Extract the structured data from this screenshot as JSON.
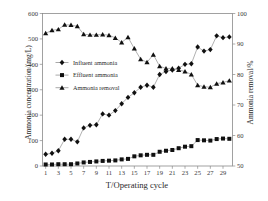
{
  "chart_data": {
    "type": "line",
    "title": "",
    "xlabel": "T/Operating cycle",
    "ylabel_left": "Ammonia concentration/(mg/L)",
    "ylabel_right": "Ammonia removal/%",
    "x": [
      1,
      2,
      3,
      4,
      5,
      6,
      7,
      8,
      9,
      10,
      11,
      12,
      13,
      14,
      15,
      16,
      17,
      18,
      19,
      20,
      21,
      22,
      23,
      24,
      25,
      26,
      27,
      28,
      29,
      30
    ],
    "xticks": [
      1,
      3,
      5,
      7,
      9,
      11,
      13,
      15,
      17,
      19,
      21,
      23,
      25,
      27,
      29
    ],
    "xlim": [
      0.5,
      30.5
    ],
    "yticks_left": [
      0,
      100,
      200,
      300,
      400,
      500,
      600
    ],
    "ylim_left": [
      0,
      600
    ],
    "yticks_right": [
      50,
      60,
      70,
      80,
      90,
      100
    ],
    "ylim_right": [
      50,
      100
    ],
    "grid": false,
    "legend_position": "upper-left-inside",
    "series": [
      {
        "name": "Influent ammonia",
        "marker": "diamond",
        "axis": "left",
        "values": [
          46,
          50,
          60,
          105,
          105,
          95,
          150,
          160,
          162,
          205,
          200,
          218,
          245,
          270,
          288,
          310,
          318,
          310,
          360,
          372,
          378,
          385,
          400,
          402,
          468,
          452,
          458,
          512,
          505,
          508
        ]
      },
      {
        "name": "Effluent ammonia",
        "marker": "square",
        "axis": "left",
        "values": [
          6,
          6,
          7,
          7,
          7,
          10,
          14,
          16,
          18,
          20,
          21,
          22,
          26,
          28,
          38,
          42,
          44,
          44,
          56,
          60,
          63,
          70,
          76,
          78,
          102,
          101,
          100,
          106,
          108,
          107
        ]
      },
      {
        "name": "Ammonia removal",
        "marker": "triangle",
        "axis": "right",
        "values": [
          93.5,
          94.5,
          94.8,
          96.3,
          96.2,
          95.8,
          93.2,
          93.0,
          93.0,
          93.1,
          92.9,
          92.0,
          90.5,
          92.2,
          88.5,
          85.0,
          84.0,
          86.5,
          82.7,
          82.0,
          82.0,
          81.5,
          81.0,
          80.0,
          76.5,
          76.0,
          75.8,
          77.0,
          77.4,
          78.0
        ]
      }
    ],
    "colors": {
      "marker": "#101010",
      "line": "#6f6f6f",
      "axis": "#8a8a8a",
      "text": "#2a2a2a",
      "background": "#ffffff"
    }
  }
}
